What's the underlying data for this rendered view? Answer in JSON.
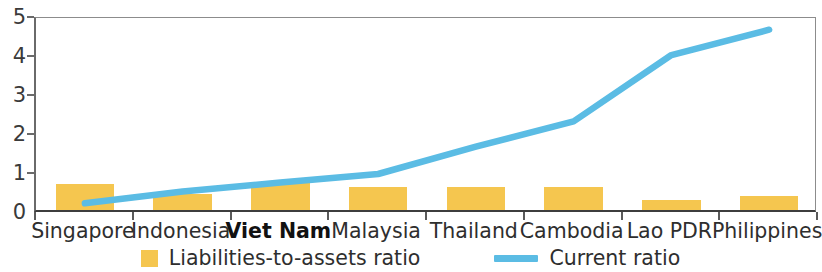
{
  "chart_data": {
    "type": "bar",
    "title": "",
    "subtitle": "",
    "xlabel": "",
    "ylabel": "",
    "ylim": [
      0,
      5
    ],
    "yticks": [
      0,
      1,
      2,
      3,
      4,
      5
    ],
    "ytick_labels": [
      "0",
      "1",
      "2",
      "3",
      "4",
      "5"
    ],
    "grid": false,
    "legend_position": "bottom-center",
    "categories": [
      "Singapore",
      "Indonesia",
      "Viet Nam",
      "Malaysia",
      "Thailand",
      "Cambodia",
      "Lao PDR",
      "Philippines"
    ],
    "highlighted_category": "Viet Nam",
    "series": [
      {
        "name": "Liabilities-to-assets ratio",
        "type": "bar",
        "color": "#F5C64F",
        "values": [
          0.67,
          0.42,
          0.72,
          0.6,
          0.58,
          0.6,
          0.25,
          0.35
        ]
      },
      {
        "name": "Current ratio",
        "type": "line",
        "color": "#5BBCE4",
        "values": [
          0.25,
          0.55,
          0.78,
          1.0,
          1.7,
          2.35,
          4.05,
          4.7
        ]
      }
    ]
  },
  "legend": {
    "items": [
      {
        "label": "Liabilities-to-assets ratio",
        "marker": "square-swatch-icon",
        "color": "#F5C64F"
      },
      {
        "label": "Current ratio",
        "marker": "line-swatch-icon",
        "color": "#5BBCE4"
      }
    ]
  },
  "colors": {
    "bar": "#F5C64F",
    "line": "#5BBCE4",
    "axis": "#3D3D3D",
    "text": "#2E2E2E",
    "background": "#FFFFFF"
  }
}
